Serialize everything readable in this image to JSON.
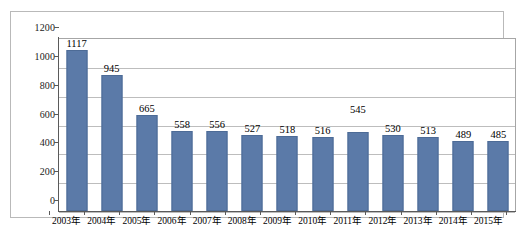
{
  "chart_data": {
    "type": "bar",
    "title": "",
    "subtitle": "",
    "xlabel": "",
    "ylabel": "",
    "categories": [
      "2003年",
      "2004年",
      "2005年",
      "2006年",
      "2007年",
      "2008年",
      "2009年",
      "2010年",
      "2011年",
      "2012年",
      "2013年",
      "2014年",
      "2015年"
    ],
    "values": [
      1117,
      945,
      665,
      558,
      556,
      527,
      518,
      516,
      545,
      530,
      513,
      489,
      485
    ],
    "series": [
      {
        "name": "",
        "values": [
          1117,
          945,
          665,
          558,
          556,
          527,
          518,
          516,
          545,
          530,
          513,
          489,
          485
        ]
      }
    ],
    "ylim": [
      0,
      1200
    ],
    "ytick_values": [
      0,
      200,
      400,
      600,
      800,
      1000,
      1200
    ],
    "ytick_labels": [
      "0",
      "200",
      "400",
      "600",
      "800",
      "1000",
      "1200"
    ],
    "grid": true,
    "grid_axis": "y",
    "legend": false,
    "legend_position": "none",
    "data_labels": [
      "1117",
      "945",
      "665",
      "558",
      "556",
      "527",
      "518",
      "516",
      "545",
      "530",
      "513",
      "489",
      "485"
    ],
    "bar_color": "#5b7aa8",
    "bar_edge_color": "#4d6b96",
    "gridline_color": "#bdbdbd",
    "axis_color": "#5a5a5a",
    "frame_color": "#b9b9b9",
    "plot_background": "#ffffff",
    "annotations": []
  }
}
